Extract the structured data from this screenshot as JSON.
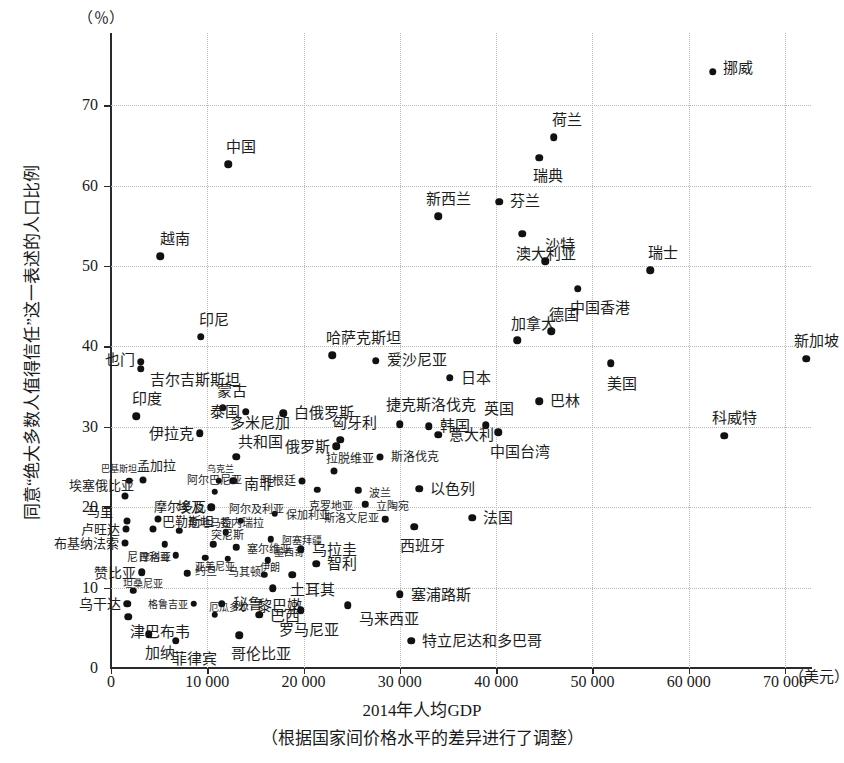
{
  "chart_data": {
    "type": "scatter",
    "title": "",
    "xlabel": "2014年人均GDP",
    "xsublabel": "（根据国家间价格水平的差异进行了调整）",
    "ylabel": "同意“绝大多数人值得信任”这一表述的人口比例",
    "y_unit": "（％）",
    "x_unit": "（美元）",
    "xlim": [
      0,
      72700
    ],
    "ylim": [
      0,
      79
    ],
    "xticks": [
      0,
      10000,
      20000,
      30000,
      40000,
      50000,
      60000,
      70000
    ],
    "xticklabels": [
      "0",
      "10 000",
      "20 000",
      "30 000",
      "40 000",
      "50 000",
      "60 000",
      "70 000"
    ],
    "yticks": [
      0,
      10,
      20,
      30,
      40,
      50,
      60,
      70
    ],
    "yticklabels": [
      "0",
      "10",
      "20",
      "30",
      "40",
      "50",
      "60",
      "70"
    ],
    "grid": true,
    "grid_style": "dotted",
    "marker_color": "#111111",
    "points": [
      {
        "label": "挪威",
        "x": 62500,
        "y": 74.2,
        "lx": 10,
        "ly": -6,
        "ls": 15
      },
      {
        "label": "荷兰",
        "x": 46000,
        "y": 66.0,
        "lx": -2,
        "ly": -20,
        "ls": 15
      },
      {
        "label": "瑞典",
        "x": 44500,
        "y": 63.5,
        "lx": -6,
        "ly": 16,
        "ls": 15
      },
      {
        "label": "中国",
        "x": 12200,
        "y": 62.7,
        "lx": -2,
        "ly": -20,
        "ls": 15
      },
      {
        "label": "芬兰",
        "x": 40300,
        "y": 58.0,
        "lx": 11,
        "ly": -3,
        "ls": 15
      },
      {
        "label": "新西兰",
        "x": 34000,
        "y": 56.2,
        "lx": -12,
        "ly": -20,
        "ls": 15
      },
      {
        "label": "澳大利亚",
        "x": 42700,
        "y": 54.0,
        "lx": -6,
        "ly": 17,
        "ls": 15
      },
      {
        "label": "越南",
        "x": 5100,
        "y": 51.2,
        "lx": 0,
        "ly": -20,
        "ls": 15
      },
      {
        "label": "沙特",
        "x": 45100,
        "y": 50.6,
        "lx": 0,
        "ly": -19,
        "ls": 15
      },
      {
        "label": "瑞士",
        "x": 56000,
        "y": 49.5,
        "lx": -2,
        "ly": -20,
        "ls": 15
      },
      {
        "label": "中国香港",
        "x": 48500,
        "y": 47.2,
        "lx": -8,
        "ly": 17,
        "ls": 15
      },
      {
        "label": "德国",
        "x": 45700,
        "y": 41.9,
        "lx": -2,
        "ly": -19,
        "ls": 15
      },
      {
        "label": "加拿大",
        "x": 42200,
        "y": 40.8,
        "lx": -6,
        "ly": -19,
        "ls": 15
      },
      {
        "label": "印尼",
        "x": 9300,
        "y": 41.2,
        "lx": -2,
        "ly": -20,
        "ls": 15
      },
      {
        "label": "哈萨克斯坦",
        "x": 23000,
        "y": 38.9,
        "lx": -6,
        "ly": -20,
        "ls": 15
      },
      {
        "label": "新加坡",
        "x": 72200,
        "y": 38.5,
        "lx": -12,
        "ly": -20,
        "ls": 15
      },
      {
        "label": "爱沙尼亚",
        "x": 27500,
        "y": 38.2,
        "lx": 11,
        "ly": -4,
        "ls": 15
      },
      {
        "label": "美国",
        "x": 51900,
        "y": 37.9,
        "lx": -4,
        "ly": 18,
        "ls": 15
      },
      {
        "label": "也门",
        "x": 3100,
        "y": 38.1,
        "lx": -50,
        "ly": -4,
        "ls": 15
      },
      {
        "label": "吉尔吉斯斯坦",
        "x": 3100,
        "y": 37.2,
        "lx": 9,
        "ly": 8,
        "ls": 15
      },
      {
        "label": "日本",
        "x": 35200,
        "y": 36.1,
        "lx": 11,
        "ly": -3,
        "ls": 15
      },
      {
        "label": "巴林",
        "x": 44500,
        "y": 33.2,
        "lx": 11,
        "ly": -3,
        "ls": 15
      },
      {
        "label": "蒙古",
        "x": 11600,
        "y": 32.4,
        "lx": -6,
        "ly": -19,
        "ls": 15
      },
      {
        "label": "泰国",
        "x": 14000,
        "y": 31.9,
        "lx": -40,
        "ly": -2,
        "ls": 15
      },
      {
        "label": "白俄罗斯",
        "x": 17900,
        "y": 31.7,
        "lx": 11,
        "ly": -3,
        "ls": 15
      },
      {
        "label": "印度",
        "x": 2600,
        "y": 31.3,
        "lx": -4,
        "ly": -20,
        "ls": 15
      },
      {
        "label": "捷克斯洛伐克",
        "x": 30000,
        "y": 30.3,
        "lx": -14,
        "ly": -22,
        "ls": 15
      },
      {
        "label": "英国",
        "x": 38900,
        "y": 30.2,
        "lx": -2,
        "ly": -19,
        "ls": 15
      },
      {
        "label": "韩国",
        "x": 33000,
        "y": 30.1,
        "lx": 11,
        "ly": -3,
        "ls": 15
      },
      {
        "label": "伊拉克",
        "x": 9200,
        "y": 29.2,
        "lx": -58,
        "ly": -2,
        "ls": 15
      },
      {
        "label": "匈牙利",
        "x": 23800,
        "y": 28.4,
        "lx": -8,
        "ly": -19,
        "ls": 15
      },
      {
        "label": "意大利",
        "x": 34000,
        "y": 29.0,
        "lx": 11,
        "ly": -3,
        "ls": 15
      },
      {
        "label": "中国台湾",
        "x": 40200,
        "y": 29.3,
        "lx": -8,
        "ly": 17,
        "ls": 15
      },
      {
        "label": "俄罗斯",
        "x": 23400,
        "y": 27.6,
        "lx": -52,
        "ly": -2,
        "ls": 15
      },
      {
        "label": "多米尼加",
        "x": 13000,
        "y": 26.3,
        "lx": -6,
        "ly": -36,
        "ls": 15
      },
      {
        "label": "共和国",
        "x": null,
        "y": null,
        "lx": null,
        "ly": null,
        "ls": 15
      },
      {
        "label": "斯洛伐克",
        "x": 27900,
        "y": 26.2,
        "lx": 11,
        "ly": -3,
        "ls": 12
      },
      {
        "label": "拉脱维亚",
        "x": 23200,
        "y": 24.5,
        "lx": -8,
        "ly": -15,
        "ls": 12
      },
      {
        "label": "阿根廷",
        "x": 19800,
        "y": 23.3,
        "lx": -38,
        "ly": -2,
        "ls": 12
      },
      {
        "label": "南非",
        "x": 12700,
        "y": 23.3,
        "lx": 11,
        "ly": 1,
        "ls": 15
      },
      {
        "label": "孟加拉",
        "x": 3300,
        "y": 23.4,
        "lx": -6,
        "ly": -17,
        "ls": 13
      },
      {
        "label": "巴基斯坦",
        "x": 1900,
        "y": 23.3,
        "lx": -28,
        "ly": -13,
        "ls": 9
      },
      {
        "label": "乌克兰",
        "x": 11200,
        "y": 23.3,
        "lx": -12,
        "ly": -13,
        "ls": 9
      },
      {
        "label": "克罗地亚",
        "x": 21400,
        "y": 22.2,
        "lx": -8,
        "ly": 14,
        "ls": 11
      },
      {
        "label": "波兰",
        "x": 25700,
        "y": 22.1,
        "lx": 11,
        "ly": 0,
        "ls": 11
      },
      {
        "label": "以色列",
        "x": 32000,
        "y": 22.3,
        "lx": 11,
        "ly": -2,
        "ls": 15
      },
      {
        "label": "埃塞俄比亚",
        "x": 1500,
        "y": 21.4,
        "lx": -56,
        "ly": -13,
        "ls": 13
      },
      {
        "label": "阿尔巴尼亚",
        "x": 10800,
        "y": 21.9,
        "lx": -28,
        "ly": -14,
        "ls": 11
      },
      {
        "label": "埃及",
        "x": 10400,
        "y": 20.0,
        "lx": -34,
        "ly": -3,
        "ls": 14
      },
      {
        "label": "立陶宛",
        "x": 26400,
        "y": 20.4,
        "lx": 11,
        "ly": 0,
        "ls": 11
      },
      {
        "label": "保加利亚",
        "x": 17000,
        "y": 19.2,
        "lx": 11,
        "ly": -1,
        "ls": 11
      },
      {
        "label": "摩尔多瓦",
        "x": 4900,
        "y": 18.5,
        "lx": -4,
        "ly": -15,
        "ls": 13
      },
      {
        "label": "阿尔及利亚",
        "x": 13500,
        "y": 18.3,
        "lx": -12,
        "ly": -14,
        "ls": 11
      },
      {
        "label": "马里",
        "x": 1700,
        "y": 18.3,
        "lx": -40,
        "ly": -12,
        "ls": 13
      },
      {
        "label": "斯洛文尼亚",
        "x": 28500,
        "y": 18.5,
        "lx": -52,
        "ly": -3,
        "ls": 11
      },
      {
        "label": "西班牙",
        "x": 31500,
        "y": 17.6,
        "lx": -14,
        "ly": 17,
        "ls": 15
      },
      {
        "label": "法国",
        "x": 37500,
        "y": 18.7,
        "lx": 11,
        "ly": -2,
        "ls": 15
      },
      {
        "label": "巴勒斯坦",
        "x": 4400,
        "y": 17.3,
        "lx": 9,
        "ly": -10,
        "ls": 13
      },
      {
        "label": "卢旺达",
        "x": 1600,
        "y": 17.3,
        "lx": -52,
        "ly": -2,
        "ls": 13
      },
      {
        "label": "危地马拉",
        "x": 7100,
        "y": 17.1,
        "lx": 9,
        "ly": -10,
        "ls": 11
      },
      {
        "label": "委内瑞拉",
        "x": 11900,
        "y": 16.9,
        "lx": -6,
        "ly": -11,
        "ls": 11
      },
      {
        "label": "阿塞拜疆",
        "x": 16600,
        "y": 16.0,
        "lx": 11,
        "ly": -1,
        "ls": 10
      },
      {
        "label": "布基纳法索",
        "x": 1500,
        "y": 15.5,
        "lx": -72,
        "ly": -2,
        "ls": 13
      },
      {
        "label": "尼日利亚",
        "x": 5600,
        "y": 15.4,
        "lx": -38,
        "ly": 11,
        "ls": 11
      },
      {
        "label": "突尼斯",
        "x": 10600,
        "y": 15.4,
        "lx": -2,
        "ly": -11,
        "ls": 11
      },
      {
        "label": "塞尔维亚",
        "x": 13000,
        "y": 15.0,
        "lx": 11,
        "ly": -1,
        "ls": 11
      },
      {
        "label": "乌拉圭",
        "x": 19700,
        "y": 14.8,
        "lx": 11,
        "ly": -2,
        "ls": 15
      },
      {
        "label": "摩洛哥",
        "x": 6700,
        "y": 14.0,
        "lx": -36,
        "ly": 0,
        "ls": 10
      },
      {
        "label": "约旦",
        "x": 9800,
        "y": 13.7,
        "lx": -10,
        "ly": 11,
        "ls": 11
      },
      {
        "label": "马其顿",
        "x": 12100,
        "y": 13.6,
        "lx": 0,
        "ly": 11,
        "ls": 11
      },
      {
        "label": "墨西哥",
        "x": 16300,
        "y": 13.4,
        "lx": 6,
        "ly": -10,
        "ls": 10
      },
      {
        "label": "智利",
        "x": 21300,
        "y": 13.0,
        "lx": 11,
        "ly": -2,
        "ls": 15
      },
      {
        "label": "赞比亚",
        "x": 3200,
        "y": 11.9,
        "lx": -50,
        "ly": -2,
        "ls": 14
      },
      {
        "label": "亚美尼亚",
        "x": 7900,
        "y": 11.8,
        "lx": 8,
        "ly": -9,
        "ls": 10
      },
      {
        "label": "伊朗",
        "x": 15900,
        "y": 11.6,
        "lx": -4,
        "ly": -10,
        "ls": 10
      },
      {
        "label": "土耳其",
        "x": 18800,
        "y": 11.6,
        "lx": -2,
        "ly": 13,
        "ls": 15
      },
      {
        "label": "坦桑尼亚",
        "x": 2300,
        "y": 9.6,
        "lx": -10,
        "ly": -10,
        "ls": 10
      },
      {
        "label": "黎巴嫩",
        "x": 16800,
        "y": 9.9,
        "lx": -16,
        "ly": 15,
        "ls": 15
      },
      {
        "label": "格鲁吉亚",
        "x": 8600,
        "y": 8.0,
        "lx": -44,
        "ly": -1,
        "ls": 10
      },
      {
        "label": "秘鲁",
        "x": 11500,
        "y": 8.0,
        "lx": 11,
        "ly": -2,
        "ls": 15
      },
      {
        "label": "乌干达",
        "x": 1700,
        "y": 8.0,
        "lx": -54,
        "ly": -2,
        "ls": 14
      },
      {
        "label": "塞浦路斯",
        "x": 30000,
        "y": 9.2,
        "lx": 11,
        "ly": -2,
        "ls": 15
      },
      {
        "label": "马来西亚",
        "x": 24600,
        "y": 7.8,
        "lx": 11,
        "ly": 11,
        "ls": 15
      },
      {
        "label": "厄瓜多尔",
        "x": 10800,
        "y": 6.6,
        "lx": -6,
        "ly": -10,
        "ls": 10
      },
      {
        "label": "巴西",
        "x": 15400,
        "y": 6.6,
        "lx": 11,
        "ly": -2,
        "ls": 15
      },
      {
        "label": "津巴布韦",
        "x": 1800,
        "y": 6.4,
        "lx": 2,
        "ly": 13,
        "ls": 15
      },
      {
        "label": "罗马尼亚",
        "x": 19700,
        "y": 7.2,
        "lx": -22,
        "ly": 17,
        "ls": 15
      },
      {
        "label": "加纳",
        "x": 3900,
        "y": 4.2,
        "lx": -4,
        "ly": 16,
        "ls": 15
      },
      {
        "label": "菲律宾",
        "x": 6700,
        "y": 3.4,
        "lx": -4,
        "ly": 16,
        "ls": 15
      },
      {
        "label": "哥伦比亚",
        "x": 13300,
        "y": 4.1,
        "lx": -8,
        "ly": 16,
        "ls": 15
      },
      {
        "label": "特立尼达和多巴哥",
        "x": 31200,
        "y": 3.4,
        "lx": 11,
        "ly": -2,
        "ls": 15
      },
      {
        "label": "科威特",
        "x": 63700,
        "y": 28.9,
        "lx": -12,
        "ly": -20,
        "ls": 15
      }
    ]
  }
}
